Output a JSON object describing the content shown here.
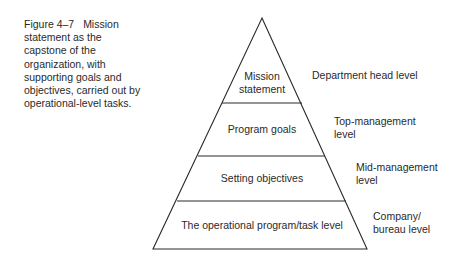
{
  "caption": {
    "figure_number": "Figure 4–7",
    "text": "Mission statement as the capstone of the organization, with supporting goals and objectives, carried out by operational-level tasks."
  },
  "pyramid": {
    "tiers": [
      {
        "label_line1": "Mission",
        "label_line2": "statement"
      },
      {
        "label_line1": "Program goals"
      },
      {
        "label_line1": "Setting objectives"
      },
      {
        "label_line1": "The operational program/task level"
      }
    ],
    "levels": [
      {
        "line1": "Department head level"
      },
      {
        "line1": "Top-management",
        "line2": "level"
      },
      {
        "line1": "Mid-management",
        "line2": "level"
      },
      {
        "line1": "Company/",
        "line2": "bureau level"
      }
    ]
  }
}
